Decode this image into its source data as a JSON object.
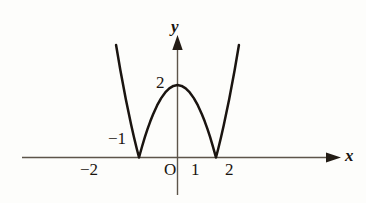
{
  "figure": {
    "background_color": "#fdfdfb",
    "curve_color": "#1a1410",
    "axis_color": "#5d554a"
  },
  "axes": {
    "x_axis_label": "x",
    "y_axis_label": "y",
    "origin_label": "O",
    "x_ticks": [
      {
        "label": "−2",
        "value": -2
      },
      {
        "label": "−1",
        "value": -1
      },
      {
        "label": "1",
        "value": 1
      },
      {
        "label": "2",
        "value": 2
      }
    ],
    "y_ticks": [
      {
        "label": "2",
        "value": 2
      }
    ]
  },
  "chart_data": {
    "type": "line",
    "title": "",
    "xlabel": "x",
    "ylabel": "y",
    "xlim": [
      -2.9,
      2.9
    ],
    "ylim": [
      -0.6,
      4.3
    ],
    "grid": false,
    "legend": "none",
    "annotations": [
      {
        "text": "2",
        "x": 0,
        "y": 2,
        "note": "y-intercept / cusp peak"
      },
      {
        "text": "O",
        "x": 0,
        "y": 0,
        "note": "origin"
      },
      {
        "text": "−2",
        "x": -2,
        "y": 0,
        "note": "x tick below axis"
      },
      {
        "text": "−1",
        "x": -1,
        "y": 0,
        "note": "x tick above axis"
      },
      {
        "text": "1",
        "x": 1,
        "y": 0,
        "note": "x tick below axis"
      },
      {
        "text": "2",
        "x": 2,
        "y": 0,
        "note": "x tick below axis"
      }
    ],
    "series": [
      {
        "name": "y = |x^2 - 2|",
        "x": [
          -2.9,
          -2.7,
          -2.5,
          -2.3,
          -2.1,
          -1.9,
          -1.7,
          -1.6,
          -1.5,
          -1.45,
          -1.4142,
          -1.38,
          -1.3,
          -1.2,
          -1.1,
          -1.0,
          -0.9,
          -0.75,
          -0.6,
          -0.45,
          -0.3,
          -0.15,
          0.0,
          0.15,
          0.3,
          0.45,
          0.6,
          0.75,
          0.9,
          1.0,
          1.1,
          1.2,
          1.3,
          1.38,
          1.4142,
          1.45,
          1.5,
          1.6,
          1.7,
          1.9,
          2.1,
          2.3,
          2.5,
          2.7,
          2.9
        ],
        "y": [
          6.41,
          5.29,
          4.25,
          3.29,
          2.41,
          1.61,
          0.89,
          0.56,
          0.25,
          0.1025,
          0.0,
          0.0956,
          0.31,
          0.56,
          0.79,
          1.0,
          1.19,
          1.4375,
          1.64,
          1.7975,
          1.91,
          1.9775,
          2.0,
          1.9775,
          1.91,
          1.7975,
          1.64,
          1.4375,
          1.19,
          1.0,
          0.79,
          0.56,
          0.31,
          0.0956,
          0.0,
          0.1025,
          0.25,
          0.56,
          0.89,
          1.61,
          2.41,
          3.29,
          4.25,
          5.29,
          6.41
        ]
      }
    ],
    "roots": [
      -1.4142,
      1.4142
    ],
    "minima": [
      {
        "x": -1.4142,
        "y": 0
      },
      {
        "x": 1.4142,
        "y": 0
      }
    ],
    "local_maxima": [
      {
        "x": 0,
        "y": 2
      }
    ],
    "shape": "W-shaped curve with cusp at (0, 2), touching x-axis at x = ±√2"
  }
}
